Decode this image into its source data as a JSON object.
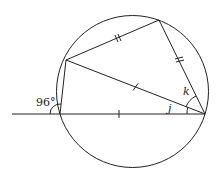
{
  "diagram": {
    "type": "circle-geometry",
    "circle": {
      "cx": 132.5,
      "cy": 91.5,
      "r": 76
    },
    "points": {
      "A": {
        "x": 60,
        "y": 114
      },
      "B": {
        "x": 205,
        "y": 114
      },
      "C": {
        "x": 66,
        "y": 60
      },
      "D": {
        "x": 159,
        "y": 20
      }
    },
    "line": {
      "x1": 12,
      "y1": 114,
      "x2": 205,
      "y2": 114
    },
    "labels": {
      "angle_exterior": "96°",
      "angle_j": "j",
      "angle_k": "k"
    },
    "markers": {
      "single_tick": "equal segments CB and AB",
      "double_tick": "equal segments CD and DB"
    },
    "stroke_color": "#222222"
  }
}
